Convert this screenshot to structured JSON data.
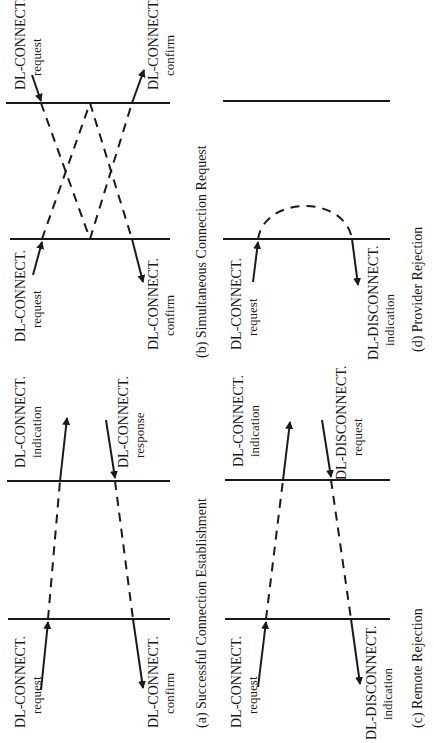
{
  "figure": {
    "orientation": "rotated-90-ccw",
    "panels": [
      {
        "id": "a",
        "caption": "(a) Successful Connection Establishment",
        "labels": {
          "left_top_1": "DL-CONNECT.",
          "left_top_2": "request",
          "left_bottom_1": "DL-CONNECT.",
          "left_bottom_2": "confirm",
          "right_top_1": "DL-CONNECT.",
          "right_top_2": "indication",
          "right_bottom_1": "DL-CONNECT.",
          "right_bottom_2": "response"
        }
      },
      {
        "id": "b",
        "caption": "(b) Simultaneous Connection Request",
        "labels": {
          "left_top_1": "DL-CONNECT.",
          "left_top_2": "request",
          "left_bottom_1": "DL-CONNECT.",
          "left_bottom_2": "confirm",
          "right_top_1": "DL-CONNECT.",
          "right_top_2": "request",
          "right_bottom_1": "DL-CONNECT.",
          "right_bottom_2": "confirm"
        }
      },
      {
        "id": "c",
        "caption": "(c) Remote Rejection",
        "labels": {
          "left_top_1": "DL-CONNECT.",
          "left_top_2": "request",
          "left_bottom_1": "DL-DISCONNECT.",
          "left_bottom_2": "indication",
          "right_top_1": "DL-CONNECT.",
          "right_top_2": "indication",
          "right_bottom_1": "DL-DISCONNECT.",
          "right_bottom_2": "request"
        }
      },
      {
        "id": "d",
        "caption": "(d) Provider Rejection",
        "labels": {
          "left_top_1": "DL-CONNECT.",
          "left_top_2": "request",
          "left_bottom_1": "DL-DISCONNECT.",
          "left_bottom_2": "indication"
        }
      }
    ]
  }
}
